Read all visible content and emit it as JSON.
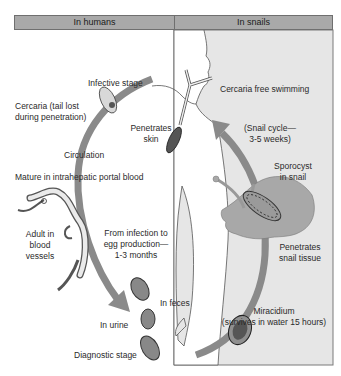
{
  "header": {
    "left_label": "In humans",
    "right_label": "In snails"
  },
  "colors": {
    "header_bg": "#a9a9a9",
    "snail_panel_bg": "#e6e6e6",
    "arrow": "#8a8a8a",
    "snail_body": "#a8a8a8"
  },
  "labels": {
    "infective_stage": "Infective stage",
    "cercaria_tail_lost_1": "Cercaria (tail lost",
    "cercaria_tail_lost_2": "during penetration)",
    "penetrates_skin_1": "Penetrates",
    "penetrates_skin_2": "skin",
    "circulation": "Circulation",
    "mature": "Mature in intrahepatic portal blood",
    "adult_1": "Adult in",
    "adult_2": "blood",
    "adult_3": "vessels",
    "from_infection_1": "From infection to",
    "from_infection_2": "egg production—",
    "from_infection_3": "1-3 months",
    "in_feces": "In feces",
    "in_urine": "In urine",
    "diagnostic_stage": "Diagnostic stage",
    "cercaria_free": "Cercaria free swimming",
    "snail_cycle_1": "(Snail cycle—",
    "snail_cycle_2": "3-5 weeks)",
    "sporocyst_1": "Sporocyst",
    "sporocyst_2": "in snail",
    "penetrates_snail_1": "Penetrates",
    "penetrates_snail_2": "snail tissue",
    "miracidium_1": "Miracidium",
    "miracidium_2": "(survives in water 15 hours)"
  }
}
